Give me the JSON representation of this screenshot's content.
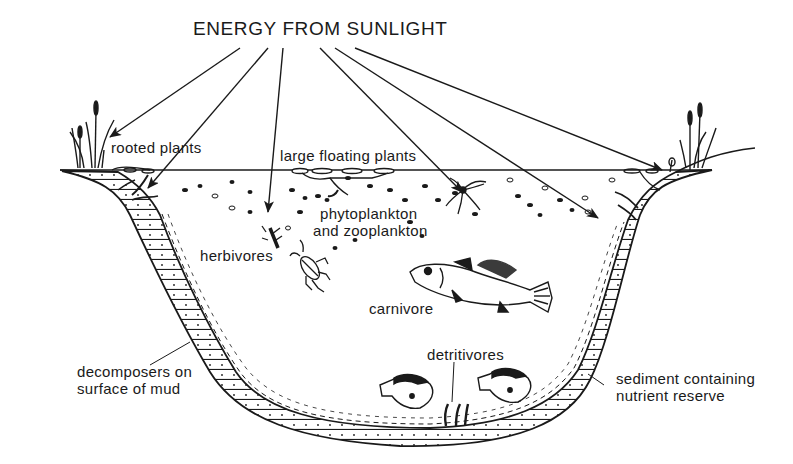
{
  "title": "ENERGY FROM SUNLIGHT",
  "labels": {
    "rooted_plants": "rooted plants",
    "large_floating_plants": "large floating plants",
    "phytoplankton_line1": "phytoplankton",
    "phytoplankton_line2": "and zooplankton",
    "herbivores": "herbivores",
    "carnivore": "carnivore",
    "detritivores": "detritivores",
    "decomposers_line1": "decomposers on",
    "decomposers_line2": "surface of mud",
    "sediment_line1": "sediment containing",
    "sediment_line2": "nutrient reserve"
  },
  "colors": {
    "ink": "#1a1a1a",
    "background": "#ffffff"
  },
  "sunlight_arrows": [
    {
      "target": "rooted-plants-left",
      "from": [
        240,
        48
      ],
      "to": [
        110,
        137
      ]
    },
    {
      "target": "rooted-plants-submerged",
      "from": [
        268,
        48
      ],
      "to": [
        148,
        188
      ]
    },
    {
      "target": "phytoplankton",
      "from": [
        283,
        48
      ],
      "to": [
        268,
        212
      ]
    },
    {
      "target": "large-floating-plants",
      "from": [
        320,
        48
      ],
      "to": [
        460,
        190
      ]
    },
    {
      "target": "open-water",
      "from": [
        335,
        48
      ],
      "to": [
        598,
        218
      ]
    },
    {
      "target": "rooted-plants-right",
      "from": [
        355,
        48
      ],
      "to": [
        660,
        170
      ]
    }
  ]
}
